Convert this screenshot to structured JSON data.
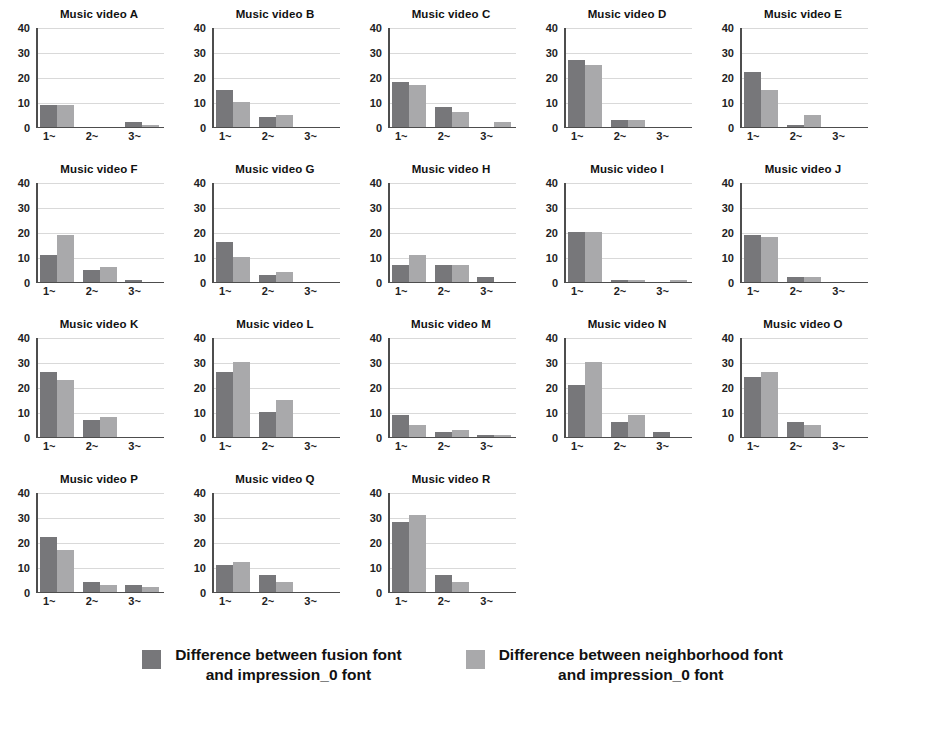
{
  "chart_data": {
    "type": "bar",
    "title": "",
    "subtitle": "",
    "xlabel": "",
    "ylabel": "",
    "categories": [
      "1~",
      "2~",
      "3~"
    ],
    "yticks": [
      0,
      10,
      20,
      30,
      40
    ],
    "ylim": [
      0,
      40
    ],
    "grid": true,
    "legend_position": "bottom",
    "series_names": [
      "Difference between fusion font\nand impression_0 font",
      "Difference between neighborhood font\nand impression_0 font"
    ],
    "series_colors": [
      "#77777a",
      "#a9a9ab"
    ],
    "panels": [
      {
        "title": "Music video A",
        "series": [
          {
            "name": "fusion",
            "values": [
              9,
              0,
              2
            ]
          },
          {
            "name": "neighborhood",
            "values": [
              9,
              0,
              1
            ]
          }
        ]
      },
      {
        "title": "Music video B",
        "series": [
          {
            "name": "fusion",
            "values": [
              15,
              4,
              0
            ]
          },
          {
            "name": "neighborhood",
            "values": [
              10,
              5,
              0
            ]
          }
        ]
      },
      {
        "title": "Music video C",
        "series": [
          {
            "name": "fusion",
            "values": [
              18,
              8,
              0
            ]
          },
          {
            "name": "neighborhood",
            "values": [
              17,
              6,
              2
            ]
          }
        ]
      },
      {
        "title": "Music video D",
        "series": [
          {
            "name": "fusion",
            "values": [
              27,
              3,
              0
            ]
          },
          {
            "name": "neighborhood",
            "values": [
              25,
              3,
              0
            ]
          }
        ]
      },
      {
        "title": "Music video E",
        "series": [
          {
            "name": "fusion",
            "values": [
              22,
              1,
              0
            ]
          },
          {
            "name": "neighborhood",
            "values": [
              15,
              5,
              0
            ]
          }
        ]
      },
      {
        "title": "Music video F",
        "series": [
          {
            "name": "fusion",
            "values": [
              11,
              5,
              1
            ]
          },
          {
            "name": "neighborhood",
            "values": [
              19,
              6,
              0
            ]
          }
        ]
      },
      {
        "title": "Music video G",
        "series": [
          {
            "name": "fusion",
            "values": [
              16,
              3,
              0
            ]
          },
          {
            "name": "neighborhood",
            "values": [
              10,
              4,
              0
            ]
          }
        ]
      },
      {
        "title": "Music video H",
        "series": [
          {
            "name": "fusion",
            "values": [
              7,
              7,
              2
            ]
          },
          {
            "name": "neighborhood",
            "values": [
              11,
              7,
              0
            ]
          }
        ]
      },
      {
        "title": "Music video I",
        "series": [
          {
            "name": "fusion",
            "values": [
              20,
              1,
              0
            ]
          },
          {
            "name": "neighborhood",
            "values": [
              20,
              1,
              1
            ]
          }
        ]
      },
      {
        "title": "Music video J",
        "series": [
          {
            "name": "fusion",
            "values": [
              19,
              2,
              0
            ]
          },
          {
            "name": "neighborhood",
            "values": [
              18,
              2,
              0
            ]
          }
        ]
      },
      {
        "title": "Music video K",
        "series": [
          {
            "name": "fusion",
            "values": [
              26,
              7,
              0
            ]
          },
          {
            "name": "neighborhood",
            "values": [
              23,
              8,
              0
            ]
          }
        ]
      },
      {
        "title": "Music video L",
        "series": [
          {
            "name": "fusion",
            "values": [
              26,
              10,
              0
            ]
          },
          {
            "name": "neighborhood",
            "values": [
              30,
              15,
              0
            ]
          }
        ]
      },
      {
        "title": "Music video M",
        "series": [
          {
            "name": "fusion",
            "values": [
              9,
              2,
              1
            ]
          },
          {
            "name": "neighborhood",
            "values": [
              5,
              3,
              1
            ]
          }
        ]
      },
      {
        "title": "Music video N",
        "series": [
          {
            "name": "fusion",
            "values": [
              21,
              6,
              2
            ]
          },
          {
            "name": "neighborhood",
            "values": [
              30,
              9,
              0
            ]
          }
        ]
      },
      {
        "title": "Music video O",
        "series": [
          {
            "name": "fusion",
            "values": [
              24,
              6,
              0
            ]
          },
          {
            "name": "neighborhood",
            "values": [
              26,
              5,
              0
            ]
          }
        ]
      },
      {
        "title": "Music video P",
        "series": [
          {
            "name": "fusion",
            "values": [
              22,
              4,
              3
            ]
          },
          {
            "name": "neighborhood",
            "values": [
              17,
              3,
              2
            ]
          }
        ]
      },
      {
        "title": "Music video Q",
        "series": [
          {
            "name": "fusion",
            "values": [
              11,
              7,
              0
            ]
          },
          {
            "name": "neighborhood",
            "values": [
              12,
              4,
              0
            ]
          }
        ]
      },
      {
        "title": "Music video R",
        "series": [
          {
            "name": "fusion",
            "values": [
              28,
              7,
              0
            ]
          },
          {
            "name": "neighborhood",
            "values": [
              31,
              4,
              0
            ]
          }
        ]
      }
    ]
  },
  "legend": {
    "entries": [
      {
        "label": "Difference between fusion font\nand impression_0 font",
        "color": "#77777a"
      },
      {
        "label": "Difference between neighborhood font\nand impression_0 font",
        "color": "#a9a9ab"
      }
    ]
  },
  "caption": {
    "text": ""
  }
}
